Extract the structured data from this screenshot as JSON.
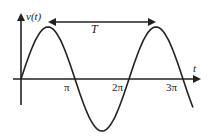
{
  "diagram": {
    "y_axis_label": "v(t)",
    "x_axis_label": "t",
    "period_label": "T",
    "tick_labels": [
      "π",
      "2π",
      "3π"
    ],
    "curve": "sine wave",
    "colors": {
      "line": "#222222",
      "background": "#ffffff"
    }
  }
}
